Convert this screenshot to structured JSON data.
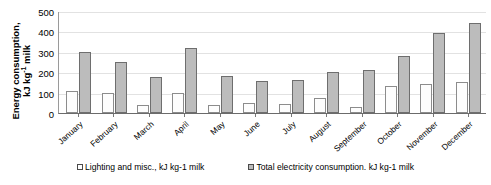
{
  "chart_data": {
    "type": "bar",
    "title": "",
    "xlabel": "",
    "ylabel": "Energy consumption, kJ kg-1 milk",
    "ylabel_parts": {
      "line1": "Energy consumption,",
      "line2_pre": "kJ kg",
      "line2_sup": "-1",
      "line2_post": " milk"
    },
    "categories": [
      "January",
      "February",
      "March",
      "April",
      "May",
      "June",
      "July",
      "August",
      "September",
      "October",
      "November",
      "December"
    ],
    "series": [
      {
        "name": "Lighting and misc., kJ kg-1 milk",
        "values": [
          110,
          100,
          40,
          100,
          40,
          50,
          45,
          75,
          30,
          130,
          140,
          150
        ],
        "color": "#ffffff"
      },
      {
        "name": "Total electricity consumption. kJ kg-1 milk",
        "values": [
          300,
          250,
          175,
          320,
          180,
          155,
          160,
          200,
          210,
          280,
          390,
          440
        ],
        "color": "#bcbcbc"
      }
    ],
    "ylim": [
      0,
      500
    ],
    "yticks": [
      500,
      400,
      300,
      200,
      100,
      0
    ],
    "grid": true,
    "legend_position": "bottom"
  },
  "legend": {
    "items": [
      {
        "label": "Lighting and misc., kJ kg-1 milk",
        "swatch": "light"
      },
      {
        "label": "Total electricity consumption. kJ kg-1 milk",
        "swatch": "dark"
      }
    ]
  }
}
